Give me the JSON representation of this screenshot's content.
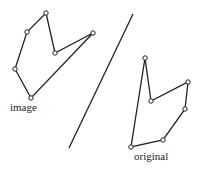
{
  "labels": {
    "image": "image",
    "original": "original"
  },
  "colors": {
    "stroke": "#222222",
    "vertex_fill": "#ffffff",
    "background": "#ffffff"
  },
  "mirror_line": {
    "x1": 133,
    "y1": 14,
    "x2": 69,
    "y2": 148
  },
  "image_polygon": [
    [
      46,
      13
    ],
    [
      55,
      53
    ],
    [
      93,
      33
    ],
    [
      31,
      98
    ],
    [
      15,
      69
    ],
    [
      27,
      32
    ]
  ],
  "original_polygon": [
    [
      145,
      58
    ],
    [
      151,
      101
    ],
    [
      188,
      82
    ],
    [
      185,
      109
    ],
    [
      163,
      140
    ],
    [
      131,
      147
    ]
  ]
}
